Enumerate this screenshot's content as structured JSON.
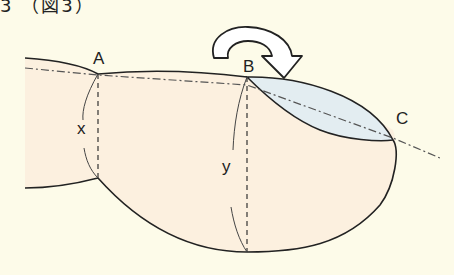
{
  "header": {
    "text_fragment": "3 （図3）"
  },
  "diagram": {
    "labels": {
      "A": "A",
      "B": "B",
      "C": "C",
      "x": "x",
      "y": "y"
    },
    "arrow": {
      "icon": "curved-arrow-clockwise-icon",
      "direction": "clockwise"
    },
    "colors": {
      "background": "#fdfbe9",
      "finger_fill": "#fcf0df",
      "nail_fill": "#e3edf1",
      "outline": "#222222",
      "center_line": "#555555"
    }
  }
}
